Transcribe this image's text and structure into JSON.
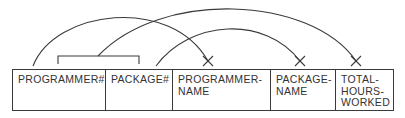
{
  "diagram": {
    "type": "functional-dependency-diagram",
    "colors": {
      "line": "#3a3a3a",
      "text": "#333333",
      "background": "#ffffff"
    },
    "attributes": [
      {
        "id": "programmer_no",
        "label": "PROGRAMMER#",
        "key": true
      },
      {
        "id": "package_no",
        "label": "PACKAGE#",
        "key": true
      },
      {
        "id": "programmer_name",
        "label": "PROGRAMMER-\nNAME",
        "key": false
      },
      {
        "id": "package_name",
        "label": "PACKAGE-\nNAME",
        "key": false
      },
      {
        "id": "total_hours_worked",
        "label": "TOTAL-\nHOURS-\nWORKED",
        "key": false
      }
    ],
    "dependencies": [
      {
        "from": [
          "PROGRAMMER#"
        ],
        "to": "PROGRAMMER-NAME"
      },
      {
        "from": [
          "PACKAGE#"
        ],
        "to": "PACKAGE-NAME"
      },
      {
        "from": [
          "PROGRAMMER#",
          "PACKAGE#"
        ],
        "to": "TOTAL-HOURS-WORKED"
      }
    ]
  }
}
